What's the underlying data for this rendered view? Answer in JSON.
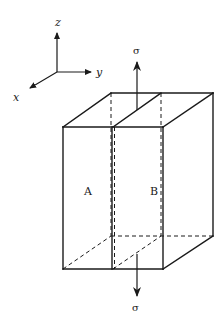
{
  "axes": {
    "z_label": "z",
    "y_label": "y",
    "x_label": "x"
  },
  "stress": {
    "top_label": "σ",
    "bottom_label": "σ"
  },
  "blocks": {
    "left_label": "A",
    "right_label": "B"
  },
  "colors": {
    "line": "#1a1a1a",
    "background": "#ffffff"
  }
}
